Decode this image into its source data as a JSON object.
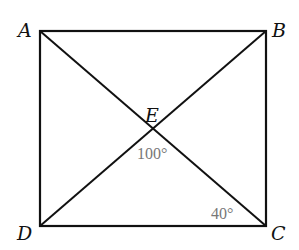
{
  "diagram": {
    "type": "rectangle-with-diagonals",
    "points": {
      "A": {
        "label": "A",
        "x": 40,
        "y": 31
      },
      "B": {
        "label": "B",
        "x": 266,
        "y": 31
      },
      "C": {
        "label": "C",
        "x": 266,
        "y": 226
      },
      "D": {
        "label": "D",
        "x": 40,
        "y": 226
      },
      "E": {
        "label": "E",
        "x": 153,
        "y": 128
      }
    },
    "angles": [
      {
        "label": "100°",
        "at": "E",
        "between": [
          "DE",
          "CE"
        ]
      },
      {
        "label": "40°",
        "at": "C",
        "between": [
          "CE",
          "CD"
        ]
      }
    ],
    "colors": {
      "lines": "#111111",
      "labels": "#111111",
      "angle_labels": "#777777"
    }
  }
}
